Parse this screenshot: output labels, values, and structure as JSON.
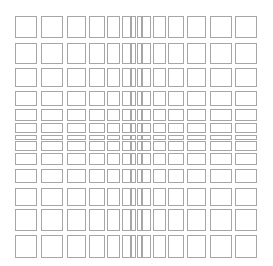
{
  "figure": {
    "line_color": "#a6a6a6",
    "background": "#ffffff",
    "columns": [
      {
        "x": 15,
        "w": 22
      },
      {
        "x": 41,
        "w": 22
      },
      {
        "x": 67,
        "w": 19
      },
      {
        "x": 89,
        "w": 16
      },
      {
        "x": 107,
        "w": 13
      },
      {
        "x": 122,
        "w": 9
      },
      {
        "x": 131,
        "w": 5
      },
      {
        "x": 137,
        "w": 5
      },
      {
        "x": 142,
        "w": 9
      },
      {
        "x": 153,
        "w": 13
      },
      {
        "x": 168,
        "w": 16
      },
      {
        "x": 187,
        "w": 19
      },
      {
        "x": 210,
        "w": 22
      },
      {
        "x": 235,
        "w": 22
      }
    ],
    "rows": [
      {
        "y": 16,
        "h": 22
      },
      {
        "y": 43,
        "h": 21
      },
      {
        "y": 68,
        "h": 19
      },
      {
        "y": 91,
        "h": 15
      },
      {
        "y": 109,
        "h": 12
      },
      {
        "y": 123,
        "h": 10
      },
      {
        "y": 135,
        "h": 5
      },
      {
        "y": 141,
        "h": 10
      },
      {
        "y": 153,
        "h": 12
      },
      {
        "y": 169,
        "h": 14
      },
      {
        "y": 188,
        "h": 18
      },
      {
        "y": 209,
        "h": 22
      },
      {
        "y": 235,
        "h": 23
      }
    ]
  }
}
